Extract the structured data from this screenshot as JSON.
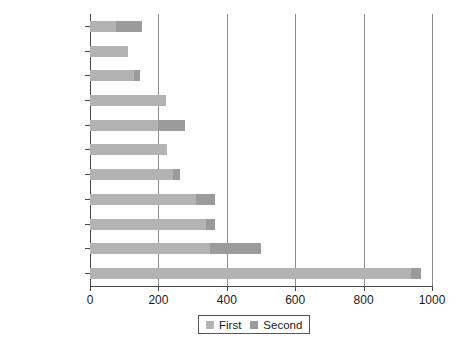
{
  "chart_data": {
    "type": "bar",
    "orientation": "horizontal",
    "stacked": true,
    "title": "",
    "xlabel": "",
    "ylabel": "",
    "xlim": [
      0,
      1000
    ],
    "xticks": [
      0,
      200,
      400,
      600,
      800,
      1000
    ],
    "xtick_labels": [
      "0",
      "200",
      "400",
      "600",
      "800",
      "1000"
    ],
    "grid": true,
    "grid_axis": "x",
    "legend_position": "bottom",
    "categories": [
      "French",
      "German",
      "Japanese",
      "Portuguese",
      "Russian",
      "Bengali",
      "Arabic",
      "Hindi",
      "Spanish",
      "English",
      "Mandarin"
    ],
    "series": [
      {
        "name": "First",
        "color": "#b3b3b3",
        "values": [
          77,
          111,
          128,
          222,
          200,
          225,
          244,
          310,
          340,
          352,
          940
        ]
      },
      {
        "name": "Second",
        "color": "#9b9b9b",
        "values": [
          75,
          0,
          18,
          0,
          78,
          0,
          19,
          55,
          25,
          148,
          28
        ]
      }
    ],
    "totals": [
      152,
      111,
      146,
      222,
      278,
      225,
      263,
      365,
      365,
      500,
      968
    ]
  },
  "legend": {
    "entries": [
      {
        "label": "First",
        "color": "#b3b3b3"
      },
      {
        "label": "Second",
        "color": "#9b9b9b"
      }
    ]
  },
  "colors": {
    "background": "#ffffff",
    "axis": "#4a4a4a",
    "grid": "#8c8c8c",
    "text": "#1a1a1a",
    "series_first": "#b3b3b3",
    "series_second": "#9b9b9b"
  }
}
